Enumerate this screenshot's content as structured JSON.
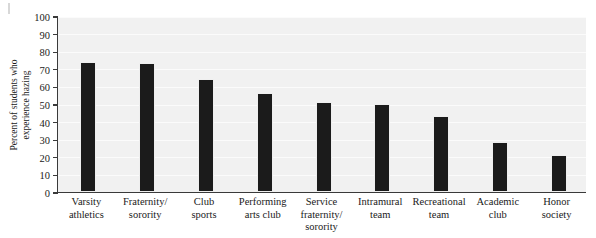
{
  "figure": {
    "background_color": "#ffffff",
    "plot_background_color": "#f1f1f1",
    "bar_color": "#1b1b1b",
    "axis_color": "#3a3a3a",
    "corner_mark": ""
  },
  "axis": {
    "ylabel_line1": "Percent of students who",
    "ylabel_line2": "experience hazing",
    "yticks": [
      "100",
      "90",
      "80",
      "70",
      "60",
      "50",
      "40",
      "30",
      "20",
      "10",
      "0"
    ]
  },
  "chart_data": {
    "type": "bar",
    "title": "",
    "xlabel": "",
    "ylabel": "Percent of students who experience hazing",
    "ylim": [
      0,
      100
    ],
    "grid": true,
    "legend": "none",
    "categories": [
      "Varsity athletics",
      "Fraternity / sorority",
      "Club sports",
      "Performing arts club",
      "Service fraternity / sorority",
      "Intramural team",
      "Recreational team",
      "Academic club",
      "Honor society"
    ],
    "category_lines": [
      [
        "Varsity",
        "athletics"
      ],
      [
        "Fraternity/",
        "sorority"
      ],
      [
        "Club",
        "sports"
      ],
      [
        "Performing",
        "arts club"
      ],
      [
        "Service",
        "fraternity/",
        "sorority"
      ],
      [
        "Intramural",
        "team"
      ],
      [
        "Recreational",
        "team"
      ],
      [
        "Academic",
        "club"
      ],
      [
        "Honor",
        "society"
      ]
    ],
    "values": [
      73,
      72,
      63,
      55,
      50,
      49,
      42,
      27,
      20
    ]
  }
}
